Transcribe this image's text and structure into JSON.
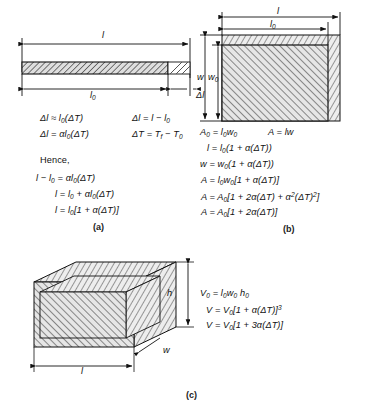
{
  "figure": {
    "ink_color": "#111111",
    "hatch_color": "#3a3a3a",
    "fill_color": "#d9d9d9"
  },
  "panel_a": {
    "label": "(a)",
    "caption": "Linear expansion of a rod",
    "diagram": {
      "length_total_label": "l",
      "length_original_label": "l₀",
      "delta_label": "Δl"
    },
    "equations": [
      {
        "id": "a1",
        "text": "Δl ≈ l₀(ΔT)"
      },
      {
        "id": "a2",
        "text": "Δl = αl₀(ΔT)"
      },
      {
        "id": "a3",
        "text": "Δl = l − l₀"
      },
      {
        "id": "a4",
        "text": "ΔT = Tf − T₀"
      },
      {
        "id": "a5",
        "text": "Hence,"
      },
      {
        "id": "a6",
        "text": "l − l₀ = αl₀(ΔT)"
      },
      {
        "id": "a7",
        "text": "l = l₀ + αl₀(ΔT)"
      },
      {
        "id": "a8",
        "text": "l = l₀[1 + α(ΔT)]"
      }
    ]
  },
  "panel_b": {
    "label": "(b)",
    "caption": "Area expansion of a plate",
    "diagram": {
      "length_total_label": "l",
      "length_original_label": "l₀",
      "width_total_label": "w",
      "width_original_label": "w₀"
    },
    "equations": [
      {
        "id": "b1",
        "text": "A₀ = l₀w₀"
      },
      {
        "id": "b2",
        "text": "A = lw"
      },
      {
        "id": "b3",
        "text": "l = l₀(1 + α(ΔT))"
      },
      {
        "id": "b4",
        "text": "w = w₀(1 + α(ΔT))"
      },
      {
        "id": "b5",
        "text": "A = l₀w₀[1 + α(ΔT)]"
      },
      {
        "id": "b6",
        "text": "A = A₀[1 + 2α(ΔT) + α²(ΔT)²]"
      },
      {
        "id": "b7",
        "text": "A = A₀[1 + 2α(ΔT)]"
      }
    ]
  },
  "panel_c": {
    "label": "(c)",
    "caption": "Volume expansion of a block",
    "diagram": {
      "length_label": "l",
      "width_label": "w",
      "height_label": "h"
    },
    "equations": [
      {
        "id": "c1",
        "text": "V₀ = l₀w₀ h₀"
      },
      {
        "id": "c2",
        "text": "V = V₀[1 + α(ΔT)]³"
      },
      {
        "id": "c3",
        "text": "V = V₀[1 + 3α(ΔT)]"
      }
    ]
  }
}
